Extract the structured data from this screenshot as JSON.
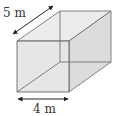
{
  "diagram": {
    "shape": "cuboid",
    "labels": {
      "depth": "5 m",
      "width": "4 m"
    },
    "colors": {
      "face_fill": "#d9d9d9",
      "edge": "#555555",
      "arrow": "#222222",
      "text": "#333333"
    }
  }
}
